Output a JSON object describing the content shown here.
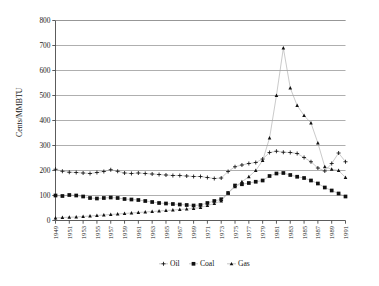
{
  "chart_data": {
    "type": "line",
    "title": "",
    "xlabel": "",
    "ylabel": "Cents/MMBTU",
    "ylim": [
      0,
      800
    ],
    "ytick_step": 100,
    "yticks": [
      0,
      100,
      200,
      300,
      400,
      500,
      600,
      700,
      800
    ],
    "grid": true,
    "legend_position": "bottom",
    "x": [
      1949,
      1950,
      1951,
      1952,
      1953,
      1954,
      1955,
      1956,
      1957,
      1958,
      1959,
      1960,
      1961,
      1962,
      1963,
      1964,
      1965,
      1966,
      1967,
      1968,
      1969,
      1970,
      1971,
      1972,
      1973,
      1974,
      1975,
      1976,
      1977,
      1978,
      1979,
      1980,
      1981,
      1982,
      1983,
      1984,
      1985,
      1986,
      1987,
      1988,
      1989,
      1990,
      1991
    ],
    "xtick_labels": [
      "1949",
      "1951",
      "1953",
      "1955",
      "1957",
      "1959",
      "1961",
      "1963",
      "1965",
      "1967",
      "1969",
      "1971",
      "1973",
      "1975",
      "1977",
      "1979",
      "1981",
      "1983",
      "1985",
      "1987",
      "1989",
      "1991"
    ],
    "series": [
      {
        "name": "Oil",
        "marker": "plus",
        "color": "#111111",
        "values": [
          205,
          197,
          193,
          192,
          190,
          188,
          192,
          196,
          203,
          197,
          190,
          188,
          190,
          188,
          186,
          184,
          182,
          180,
          180,
          178,
          176,
          176,
          172,
          168,
          170,
          196,
          215,
          222,
          228,
          232,
          246,
          272,
          277,
          273,
          272,
          268,
          252,
          235,
          210,
          198,
          228,
          270,
          235
        ]
      },
      {
        "name": "Coal",
        "marker": "square",
        "color": "#111111",
        "values": [
          100,
          98,
          102,
          100,
          96,
          90,
          88,
          90,
          92,
          90,
          86,
          84,
          82,
          78,
          74,
          70,
          68,
          66,
          64,
          62,
          60,
          62,
          70,
          78,
          85,
          110,
          140,
          145,
          150,
          155,
          160,
          178,
          188,
          190,
          182,
          175,
          170,
          160,
          148,
          132,
          120,
          108,
          96
        ]
      },
      {
        "name": "Gas",
        "marker": "triangle",
        "color": "#111111",
        "values": [
          10,
          12,
          13,
          14,
          16,
          18,
          20,
          22,
          24,
          26,
          28,
          30,
          32,
          34,
          36,
          38,
          40,
          42,
          44,
          46,
          48,
          52,
          60,
          68,
          78,
          110,
          135,
          155,
          175,
          200,
          240,
          330,
          500,
          690,
          530,
          460,
          420,
          390,
          310,
          215,
          205,
          200,
          172
        ]
      }
    ]
  },
  "legend": {
    "items": [
      {
        "label": "Oil",
        "marker": "plus"
      },
      {
        "label": "Coal",
        "marker": "square"
      },
      {
        "label": "Gas",
        "marker": "triangle"
      }
    ]
  }
}
